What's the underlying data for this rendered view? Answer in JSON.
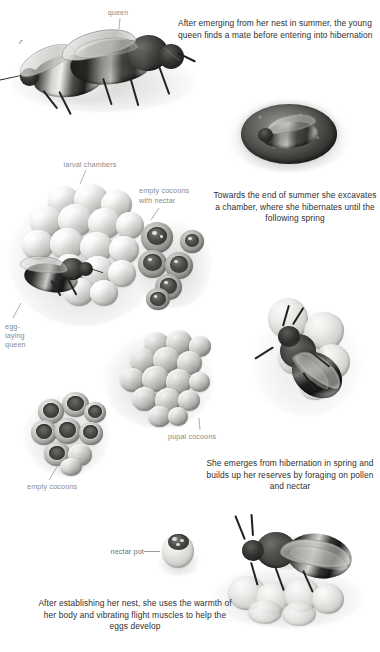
{
  "document": {
    "title": "Bumblebee life cycle illustration",
    "background_color": "#ffffff",
    "caption_color": "#2f2f2f",
    "label_color": "#8a8a8a"
  },
  "captions": [
    {
      "id": "mating",
      "text": "After emerging from her nest in summer, the young queen finds a mate before entering into hibernation"
    },
    {
      "id": "hibernation",
      "text": "Towards the end of summer she excavates a chamber, where she hibernates until the following spring"
    },
    {
      "id": "emergence",
      "text": "She emerges from hibernation in spring and builds up her reserves by foraging on pollen and nectar"
    },
    {
      "id": "nest-establish",
      "text": "After establishing her nest, she uses the warmth of her body and vibrating flight muscles to help the eggs develop"
    }
  ],
  "labels": {
    "queen": "queen",
    "male_symbol": "♂",
    "larval_chambers": "larval chambers",
    "empty_cocoons_with_nectar_line1": "empty cocoons",
    "empty_cocoons_with_nectar_line2": "with nectar",
    "egg_laying_queen_line1": "egg-",
    "egg_laying_queen_line2": "laying",
    "egg_laying_queen_line3": "queen",
    "pupal_cocoons": "pupal cocoons",
    "empty_cocoons": "empty cocoons",
    "nectar_pot": "nectar pot"
  },
  "illustrations": [
    {
      "id": "mating-pair",
      "name": "mating-pair-illustration",
      "description": "male bumblebee mating with queen"
    },
    {
      "id": "hibernation-chamber",
      "name": "hibernation-chamber-illustration",
      "description": "queen curled inside earth chamber"
    },
    {
      "id": "nest-cells",
      "name": "nest-cells-illustration",
      "description": "cluster of larval chambers with egg-laying queen"
    },
    {
      "id": "nectar-cocoons",
      "name": "nectar-cocoons-illustration",
      "description": "empty cocoons filled with nectar"
    },
    {
      "id": "pupal-cluster",
      "name": "pupal-cocoons-illustration",
      "description": "cluster of pupal cocoons"
    },
    {
      "id": "empty-cups",
      "name": "empty-cocoons-illustration",
      "description": "cluster of opened empty cocoons"
    },
    {
      "id": "foraging-bee",
      "name": "foraging-bee-illustration",
      "description": "queen foraging on pollen"
    },
    {
      "id": "nectar-pot",
      "name": "nectar-pot-illustration",
      "description": "single waxy nectar pot"
    },
    {
      "id": "brooding-queen",
      "name": "brooding-queen-illustration",
      "description": "queen incubating egg cells"
    }
  ]
}
